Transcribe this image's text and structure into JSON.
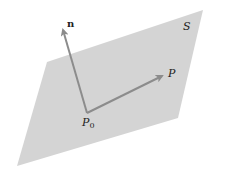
{
  "diagram": {
    "type": "plane-with-normal-vector",
    "colors": {
      "plane_fill": "#d4d4d4",
      "arrow": "#8c8c8c",
      "text": "#222222",
      "background": "#ffffff"
    },
    "plane": {
      "label": "S",
      "corners": [
        [
          203,
          10
        ],
        [
          178,
          118
        ],
        [
          17,
          166
        ],
        [
          47,
          62
        ]
      ]
    },
    "origin_point": {
      "label": "P",
      "subscript": "0",
      "x": 87,
      "y": 113
    },
    "vectors": [
      {
        "name": "normal",
        "label": "n",
        "bold": true,
        "tip": [
          62,
          27
        ]
      },
      {
        "name": "to-point",
        "label": "P",
        "bold": false,
        "tip": [
          165,
          75
        ]
      }
    ]
  }
}
